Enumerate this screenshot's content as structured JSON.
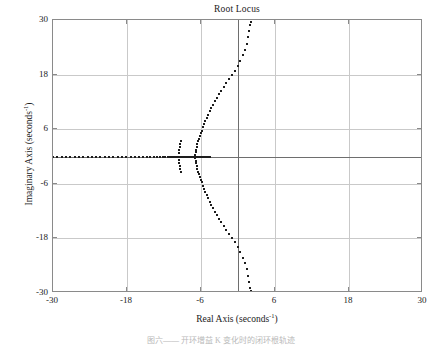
{
  "chart_data": {
    "type": "scatter",
    "title": "Root Locus",
    "xlabel_text": "Real Axis (seconds",
    "xlabel_exp": "-1",
    "xlabel_tail": ")",
    "ylabel_text": "Imaginary Axis (seconds",
    "ylabel_exp": "-1",
    "ylabel_tail": ")",
    "xlim": [
      -30,
      30
    ],
    "ylim": [
      -30,
      30
    ],
    "xticks": [
      -30,
      -18,
      -6,
      6,
      18,
      30
    ],
    "xtick_labels": [
      "-30",
      "-18",
      "-6",
      "6",
      "18",
      "30"
    ],
    "yticks": [
      -30,
      -18,
      -6,
      6,
      18,
      30
    ],
    "ytick_labels": [
      "-30",
      "-18",
      "-6",
      "6",
      "18",
      "30"
    ],
    "grid": true,
    "legend": "none",
    "marker": "square-dot",
    "marker_color": "#1d1d1d",
    "grid_color": "#c9c9c9",
    "axis_color": "#6e6e6e",
    "frame_color": "#8a8a8a",
    "background": "#ffffff",
    "series": [
      {
        "name": "real-axis-branch-left",
        "comment": "Locus along negative real axis running from breakaway near -8 out toward -30 and beyond",
        "points": [
          [
            -30.0,
            0
          ],
          [
            -29.3,
            0
          ],
          [
            -28.6,
            0
          ],
          [
            -27.9,
            0
          ],
          [
            -27.2,
            0
          ],
          [
            -26.5,
            0
          ],
          [
            -25.8,
            0
          ],
          [
            -25.1,
            0
          ],
          [
            -24.4,
            0
          ],
          [
            -23.7,
            0
          ],
          [
            -23.0,
            0
          ],
          [
            -22.3,
            0
          ],
          [
            -21.6,
            0
          ],
          [
            -20.9,
            0
          ],
          [
            -20.2,
            0
          ],
          [
            -19.5,
            0
          ],
          [
            -18.8,
            0
          ],
          [
            -18.1,
            0
          ],
          [
            -17.4,
            0
          ],
          [
            -16.7,
            0
          ],
          [
            -16.0,
            0
          ],
          [
            -15.4,
            0
          ],
          [
            -14.8,
            0
          ],
          [
            -14.2,
            0
          ],
          [
            -13.6,
            0
          ],
          [
            -13.1,
            0
          ],
          [
            -12.6,
            0
          ],
          [
            -12.2,
            0
          ],
          [
            -11.8,
            0
          ],
          [
            -11.4,
            0
          ],
          [
            -11.1,
            0
          ],
          [
            -10.8,
            0
          ],
          [
            -10.5,
            0
          ],
          [
            -10.3,
            0
          ],
          [
            -10.1,
            0
          ],
          [
            -9.9,
            0
          ],
          [
            -9.75,
            0
          ],
          [
            -9.6,
            0
          ],
          [
            -9.5,
            0
          ],
          [
            -9.4,
            0
          ],
          [
            -9.3,
            0
          ],
          [
            -9.2,
            0
          ],
          [
            -9.1,
            0
          ],
          [
            -9.0,
            0
          ]
        ]
      },
      {
        "name": "real-axis-branch-mid",
        "comment": "Short real-axis segment between the pole cluster near -9.5 and the breakaway near -7",
        "points": [
          [
            -8.9,
            0
          ],
          [
            -8.7,
            0
          ],
          [
            -8.5,
            0
          ],
          [
            -8.3,
            0
          ],
          [
            -8.1,
            0
          ],
          [
            -7.9,
            0
          ],
          [
            -7.7,
            0
          ],
          [
            -7.5,
            0
          ],
          [
            -7.3,
            0
          ],
          [
            -7.15,
            0
          ],
          [
            -7.0,
            0
          ]
        ]
      },
      {
        "name": "real-axis-branch-right",
        "comment": "Real-axis locus right of the breakaway toward -4.5",
        "points": [
          [
            -6.8,
            0
          ],
          [
            -6.5,
            0
          ],
          [
            -6.2,
            0
          ],
          [
            -5.9,
            0
          ],
          [
            -5.6,
            0
          ],
          [
            -5.3,
            0
          ],
          [
            -5.0,
            0
          ],
          [
            -4.8,
            0
          ],
          [
            -4.6,
            0
          ]
        ]
      },
      {
        "name": "vertical-stub-upper",
        "comment": "Short vertical departure branch above the pole cluster near -9.5",
        "points": [
          [
            -9.5,
            0.7
          ],
          [
            -9.5,
            1.4
          ],
          [
            -9.45,
            2.1
          ],
          [
            -9.4,
            2.8
          ],
          [
            -9.3,
            3.4
          ]
        ]
      },
      {
        "name": "vertical-stub-lower",
        "comment": "Short vertical departure branch below the pole cluster near -9.5",
        "points": [
          [
            -9.5,
            -0.7
          ],
          [
            -9.5,
            -1.4
          ],
          [
            -9.45,
            -2.1
          ],
          [
            -9.4,
            -2.8
          ],
          [
            -9.3,
            -3.4
          ]
        ]
      },
      {
        "name": "complex-branch-upper",
        "comment": "Upper complex-conjugate branch leaving breakaway near -7 and crossing the imaginary axis near +18",
        "points": [
          [
            -6.9,
            0.4
          ],
          [
            -6.85,
            0.9
          ],
          [
            -6.8,
            1.5
          ],
          [
            -6.7,
            2.1
          ],
          [
            -6.6,
            2.7
          ],
          [
            -6.5,
            3.3
          ],
          [
            -6.35,
            3.9
          ],
          [
            -6.2,
            4.5
          ],
          [
            -6.05,
            5.1
          ],
          [
            -5.9,
            5.7
          ],
          [
            -5.7,
            6.4
          ],
          [
            -5.5,
            7.1
          ],
          [
            -5.3,
            7.8
          ],
          [
            -5.05,
            8.5
          ],
          [
            -4.8,
            9.2
          ],
          [
            -4.55,
            9.9
          ],
          [
            -4.3,
            10.6
          ],
          [
            -4.0,
            11.3
          ],
          [
            -3.7,
            12.1
          ],
          [
            -3.4,
            12.9
          ],
          [
            -3.05,
            13.7
          ],
          [
            -2.7,
            14.5
          ],
          [
            -2.3,
            15.3
          ],
          [
            -1.9,
            16.2
          ],
          [
            -1.45,
            17.1
          ],
          [
            -1.0,
            18.0
          ],
          [
            -0.5,
            18.9
          ],
          [
            0.0,
            19.9
          ],
          [
            0.4,
            21.0
          ],
          [
            0.8,
            22.2
          ],
          [
            1.1,
            23.5
          ],
          [
            1.4,
            24.8
          ],
          [
            1.65,
            26.2
          ],
          [
            1.85,
            27.6
          ],
          [
            2.0,
            29.0
          ],
          [
            2.1,
            29.6
          ]
        ]
      },
      {
        "name": "complex-branch-lower",
        "comment": "Lower complex-conjugate branch mirroring the upper one",
        "points": [
          [
            -6.9,
            -0.4
          ],
          [
            -6.85,
            -0.9
          ],
          [
            -6.8,
            -1.5
          ],
          [
            -6.7,
            -2.1
          ],
          [
            -6.6,
            -2.7
          ],
          [
            -6.5,
            -3.3
          ],
          [
            -6.35,
            -3.9
          ],
          [
            -6.2,
            -4.5
          ],
          [
            -6.05,
            -5.1
          ],
          [
            -5.9,
            -5.7
          ],
          [
            -5.7,
            -6.4
          ],
          [
            -5.5,
            -7.1
          ],
          [
            -5.3,
            -7.8
          ],
          [
            -5.05,
            -8.5
          ],
          [
            -4.8,
            -9.2
          ],
          [
            -4.55,
            -9.9
          ],
          [
            -4.3,
            -10.6
          ],
          [
            -4.0,
            -11.3
          ],
          [
            -3.7,
            -12.1
          ],
          [
            -3.4,
            -12.9
          ],
          [
            -3.05,
            -13.7
          ],
          [
            -2.7,
            -14.5
          ],
          [
            -2.3,
            -15.3
          ],
          [
            -1.9,
            -16.2
          ],
          [
            -1.45,
            -17.1
          ],
          [
            -1.0,
            -18.0
          ],
          [
            -0.5,
            -18.9
          ],
          [
            0.0,
            -19.9
          ],
          [
            0.4,
            -21.0
          ],
          [
            0.8,
            -22.2
          ],
          [
            1.1,
            -23.5
          ],
          [
            1.4,
            -24.8
          ],
          [
            1.65,
            -26.2
          ],
          [
            1.85,
            -27.6
          ],
          [
            2.0,
            -29.0
          ],
          [
            2.1,
            -29.6
          ]
        ]
      },
      {
        "name": "pole-cluster-breakaway",
        "comment": "Dense cluster of markers at the breakaway point near -7",
        "points": [
          [
            -7.05,
            0.15
          ],
          [
            -7.0,
            -0.15
          ],
          [
            -6.95,
            0.05
          ],
          [
            -7.1,
            0.0
          ]
        ]
      }
    ]
  },
  "caption": {
    "text": "图六—— 开环增益 K 变化时的闭环根轨迹"
  }
}
